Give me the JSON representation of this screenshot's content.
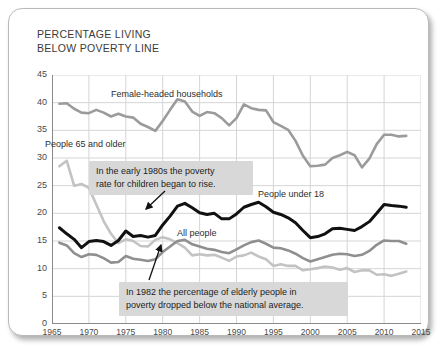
{
  "card": {
    "title": "PERCENTAGE LIVING\nBELOW POVERTY LINE"
  },
  "chart_data": {
    "type": "line",
    "title": "PERCENTAGE LIVING BELOW POVERTY LINE",
    "xlabel": "",
    "ylabel": "",
    "xlim": [
      1965,
      2015
    ],
    "ylim": [
      0,
      45
    ],
    "ytick_step": 5,
    "xtick_step": 5,
    "grid": true,
    "legend": "inline-labels",
    "xticks": [
      1965,
      1970,
      1975,
      1980,
      1985,
      1990,
      1995,
      2000,
      2005,
      2010,
      2015
    ],
    "yticks": [
      0,
      5,
      10,
      15,
      20,
      25,
      30,
      35,
      40,
      45
    ],
    "series": [
      {
        "name": "Female-headed households",
        "color": "#9b9b9b",
        "x": [
          1966,
          1967,
          1968,
          1969,
          1970,
          1971,
          1972,
          1973,
          1974,
          1975,
          1976,
          1977,
          1978,
          1979,
          1980,
          1981,
          1982,
          1983,
          1984,
          1985,
          1986,
          1987,
          1988,
          1989,
          1990,
          1991,
          1992,
          1993,
          1994,
          1995,
          1996,
          1997,
          1998,
          1999,
          2000,
          2001,
          2002,
          2003,
          2004,
          2005,
          2006,
          2007,
          2008,
          2009,
          2010,
          2011,
          2012,
          2013
        ],
        "values": [
          39.8,
          39.9,
          38.9,
          38.2,
          38.1,
          38.7,
          38.2,
          37.5,
          38.0,
          37.5,
          37.3,
          36.2,
          35.6,
          34.9,
          36.7,
          38.7,
          40.6,
          40.2,
          38.4,
          37.6,
          38.3,
          38.1,
          37.2,
          35.9,
          37.2,
          39.7,
          39.0,
          38.7,
          38.6,
          36.5,
          35.8,
          35.1,
          33.1,
          30.4,
          28.5,
          28.6,
          28.8,
          30.0,
          30.5,
          31.1,
          30.5,
          28.3,
          29.9,
          32.5,
          34.2,
          34.2,
          33.9,
          34.0
        ]
      },
      {
        "name": "People 65 and older",
        "color": "#c3c3c3",
        "x": [
          1966,
          1967,
          1968,
          1969,
          1970,
          1971,
          1972,
          1973,
          1974,
          1975,
          1976,
          1977,
          1978,
          1979,
          1980,
          1981,
          1982,
          1983,
          1984,
          1985,
          1986,
          1987,
          1988,
          1989,
          1990,
          1991,
          1992,
          1993,
          1994,
          1995,
          1996,
          1997,
          1998,
          1999,
          2000,
          2001,
          2002,
          2003,
          2004,
          2005,
          2006,
          2007,
          2008,
          2009,
          2010,
          2011,
          2012,
          2013
        ],
        "values": [
          28.5,
          29.5,
          25.0,
          25.3,
          24.6,
          21.6,
          18.6,
          16.3,
          14.6,
          15.3,
          15.0,
          14.1,
          14.0,
          15.2,
          15.7,
          15.3,
          14.6,
          13.8,
          12.4,
          12.6,
          12.4,
          12.5,
          12.0,
          11.4,
          12.2,
          12.4,
          12.9,
          12.2,
          11.7,
          10.5,
          10.8,
          10.5,
          10.5,
          9.7,
          9.9,
          10.1,
          10.4,
          10.2,
          9.8,
          10.1,
          9.4,
          9.7,
          9.7,
          8.9,
          9.0,
          8.7,
          9.1,
          9.5
        ]
      },
      {
        "name": "All people",
        "color": "#8f8f8f",
        "x": [
          1966,
          1967,
          1968,
          1969,
          1970,
          1971,
          1972,
          1973,
          1974,
          1975,
          1976,
          1977,
          1978,
          1979,
          1980,
          1981,
          1982,
          1983,
          1984,
          1985,
          1986,
          1987,
          1988,
          1989,
          1990,
          1991,
          1992,
          1993,
          1994,
          1995,
          1996,
          1997,
          1998,
          1999,
          2000,
          2001,
          2002,
          2003,
          2004,
          2005,
          2006,
          2007,
          2008,
          2009,
          2010,
          2011,
          2012,
          2013
        ],
        "values": [
          14.7,
          14.2,
          12.8,
          12.1,
          12.6,
          12.5,
          11.9,
          11.1,
          11.2,
          12.3,
          11.8,
          11.6,
          11.4,
          11.7,
          13.0,
          14.0,
          15.0,
          15.2,
          14.4,
          14.0,
          13.6,
          13.4,
          13.0,
          12.8,
          13.5,
          14.2,
          14.8,
          15.1,
          14.5,
          13.8,
          13.7,
          13.3,
          12.7,
          11.9,
          11.3,
          11.7,
          12.1,
          12.5,
          12.7,
          12.6,
          12.3,
          12.5,
          13.2,
          14.3,
          15.1,
          15.0,
          15.0,
          14.5
        ]
      },
      {
        "name": "People under 18",
        "color": "#111111",
        "x": [
          1966,
          1967,
          1968,
          1969,
          1970,
          1971,
          1972,
          1973,
          1974,
          1975,
          1976,
          1977,
          1978,
          1979,
          1980,
          1981,
          1982,
          1983,
          1984,
          1985,
          1986,
          1987,
          1988,
          1989,
          1990,
          1991,
          1992,
          1993,
          1994,
          1995,
          1996,
          1997,
          1998,
          1999,
          2000,
          2001,
          2002,
          2003,
          2004,
          2005,
          2006,
          2007,
          2008,
          2009,
          2010,
          2011,
          2012,
          2013
        ],
        "values": [
          17.4,
          16.3,
          15.3,
          13.8,
          14.9,
          15.1,
          14.9,
          14.2,
          15.1,
          16.8,
          15.8,
          16.0,
          15.7,
          16.0,
          17.9,
          19.5,
          21.3,
          21.8,
          21.0,
          20.1,
          19.8,
          20.0,
          19.0,
          19.0,
          19.9,
          21.1,
          21.6,
          22.0,
          21.2,
          20.2,
          19.8,
          19.2,
          18.3,
          16.9,
          15.6,
          15.8,
          16.3,
          17.2,
          17.3,
          17.1,
          16.9,
          17.6,
          18.5,
          20.0,
          21.6,
          21.4,
          21.3,
          21.1
        ]
      }
    ],
    "annotations": [
      {
        "id": "children-rise",
        "text": "In the early 1980s the poverty\nrate for children began to rise.",
        "points_to_series": "People under 18"
      },
      {
        "id": "elderly-below-average",
        "text": "In 1982 the percentage of elderly people in\npoverty dropped below the national average.",
        "points_to_series": "People 65 and older"
      }
    ],
    "series_labels": [
      {
        "name": "Female-headed households"
      },
      {
        "name": "People 65 and older"
      },
      {
        "name": "People under 18"
      },
      {
        "name": "All people"
      }
    ]
  },
  "colors": {
    "grid": "#d5d5d5",
    "axis": "#8a8a8a",
    "callout_bg": "#d8d8d8",
    "text": "#3b3b3b"
  }
}
